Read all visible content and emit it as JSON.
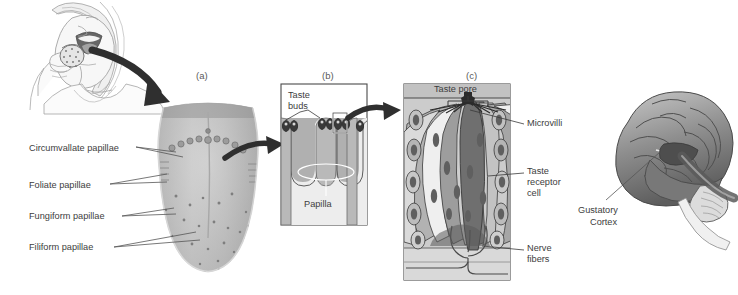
{
  "figure": {
    "domain_title": "Gustatory system anatomy",
    "background": "#ffffff",
    "text_color": "#3d3d3d"
  },
  "panel_tags": [
    {
      "id": "a",
      "label": "(a)",
      "x": 196,
      "y": 70
    },
    {
      "id": "b",
      "label": "(b)",
      "x": 322,
      "y": 70
    },
    {
      "id": "c",
      "label": "(c)",
      "x": 466,
      "y": 70
    }
  ],
  "woman_scene": {
    "name": "woman-eating-strawberry",
    "description": "line drawing of a woman biting a strawberry",
    "arrow_to": "tongue-photo"
  },
  "tongue_panel": {
    "name": "tongue-surface-photo",
    "labels": [
      {
        "text": "Circumvallate papillae",
        "x": 29,
        "y": 149,
        "line_to_x": 232,
        "line_to_y": 152
      },
      {
        "text": "Foliate papillae",
        "x": 29,
        "y": 186,
        "line_to_x": 228,
        "line_to_y": 180
      },
      {
        "text": "Fungiform papillae",
        "x": 29,
        "y": 219,
        "line_to_x": 236,
        "line_to_y": 215
      },
      {
        "text": "Filiform papillae",
        "x": 29,
        "y": 250,
        "line_to_x": 232,
        "line_to_y": 238
      }
    ]
  },
  "papilla_panel": {
    "name": "papilla-cross-section",
    "labels": [
      {
        "text": "Taste",
        "x": 288,
        "y": 96
      },
      {
        "text": "buds",
        "x": 288,
        "y": 107
      },
      {
        "text": "Papilla",
        "x": 304,
        "y": 203
      }
    ]
  },
  "taste_bud_panel": {
    "name": "taste-bud-detail",
    "labels": [
      {
        "text": "Taste pore",
        "x": 431,
        "y": 95
      },
      {
        "text": "Microvilli",
        "x": 527,
        "y": 121
      },
      {
        "text": "Taste",
        "x": 527,
        "y": 170
      },
      {
        "text": "receptor",
        "x": 527,
        "y": 181
      },
      {
        "text": "cell",
        "x": 527,
        "y": 192
      },
      {
        "text": "Nerve",
        "x": 527,
        "y": 247
      },
      {
        "text": "fibers",
        "x": 527,
        "y": 258
      }
    ]
  },
  "brain_panel": {
    "name": "brain-lateral-view",
    "labels": [
      {
        "text": "Gustatory",
        "x": 578,
        "y": 209
      },
      {
        "text": "Cortex",
        "x": 590,
        "y": 221
      }
    ]
  },
  "colors": {
    "ink": "#3d3d3d",
    "arrow": "#2b2b2b",
    "panel_border": "#4a4a4a",
    "panel_fill_b": "#9a9a9a",
    "panel_fill_c": "#b4b4b4",
    "leader": "#555555"
  }
}
